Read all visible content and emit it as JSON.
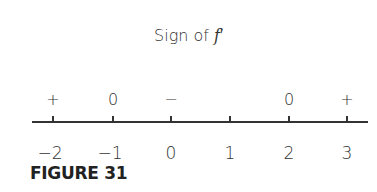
{
  "title": {
    "prefix": "Sign of ",
    "func": "f",
    "prime": "′"
  },
  "caption": "FIGURE 31",
  "number_line": {
    "ticks": [
      {
        "value": "−2",
        "x": 53,
        "sign": "+"
      },
      {
        "value": "−1",
        "x": 113,
        "sign": "0"
      },
      {
        "value": "0",
        "x": 171,
        "sign": "−"
      },
      {
        "value": "1",
        "x": 230,
        "sign": ""
      },
      {
        "value": "2",
        "x": 289,
        "sign": "0"
      },
      {
        "value": "3",
        "x": 347,
        "sign": "+"
      }
    ]
  }
}
